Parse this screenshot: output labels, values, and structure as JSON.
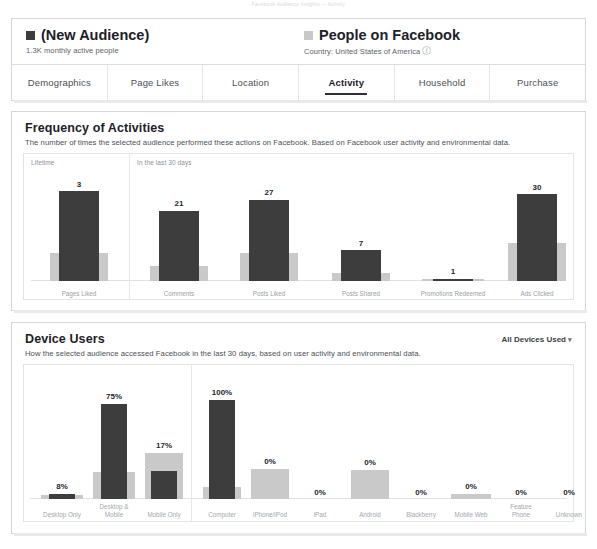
{
  "top_note": "Facebook Audience Insights — Activity",
  "header": {
    "audience": {
      "swatch": "dark-square-swatch",
      "title": "(New Audience)",
      "subtitle": "1.3K monthly active people"
    },
    "benchmark": {
      "swatch": "light-square-swatch",
      "title": "People on Facebook",
      "subtitle": "Country: United States of America",
      "info_icon": "i"
    },
    "tabs": [
      {
        "label": "Demographics",
        "active": false
      },
      {
        "label": "Page Likes",
        "active": false
      },
      {
        "label": "Location",
        "active": false
      },
      {
        "label": "Activity",
        "active": true
      },
      {
        "label": "Household",
        "active": false
      },
      {
        "label": "Purchase",
        "active": false
      }
    ]
  },
  "colors": {
    "audience_bar": "#3d3d3d",
    "benchmark_bar": "#c9c9c9",
    "card_border": "#d3d6db",
    "text_primary": "#1d2129",
    "text_muted": "#9aa0a8"
  },
  "activity_section": {
    "title": "Frequency of Activities",
    "description": "The number of times the selected audience performed these actions on Facebook. Based on Facebook user activity and environmental data.",
    "panel_labels": {
      "left": "Lifetime",
      "right": "In the last 30 days"
    }
  },
  "device_section": {
    "title": "Device Users",
    "description": "How the selected audience accessed Facebook in the last 30 days, based on user activity and environmental data.",
    "filter_label": "All Devices Used",
    "filter_caret": "chevron-down-icon"
  },
  "chart_data": [
    {
      "type": "bar",
      "title": "Frequency of Activities",
      "xlabel": "",
      "ylabel": "Number of times",
      "grid": false,
      "legend_position": "top",
      "panels": [
        {
          "name": "Lifetime",
          "categories": [
            "Pages Liked"
          ]
        },
        {
          "name": "In the last 30 days",
          "categories": [
            "Comments",
            "Posts Liked",
            "Posts Shared",
            "Promotions Redeemed",
            "Ads Clicked"
          ]
        }
      ],
      "categories": [
        "Pages Liked",
        "Comments",
        "Posts Liked",
        "Posts Shared",
        "Promotions Redeemed",
        "Ads Clicked"
      ],
      "series": [
        {
          "name": "(New Audience)",
          "labels": [
            "3",
            "21",
            "27",
            "7",
            "1",
            "30"
          ],
          "values": [
            3,
            21,
            27,
            7,
            1,
            30
          ],
          "bar_heights_pct": [
            87,
            68,
            79,
            30,
            2,
            84
          ]
        },
        {
          "name": "People on Facebook",
          "labels": [
            "",
            "",
            "",
            "",
            "",
            ""
          ],
          "values": [
            null,
            null,
            null,
            null,
            null,
            null
          ],
          "bar_heights_pct": [
            27,
            15,
            27,
            8,
            2,
            37
          ]
        }
      ]
    },
    {
      "type": "bar",
      "title": "Device Users",
      "xlabel": "",
      "ylabel": "Percent of audience",
      "grid": false,
      "legend_position": "top",
      "panels": [
        {
          "name": "Device mix",
          "categories": [
            "Desktop Only",
            "Desktop & Mobile",
            "Mobile Only"
          ]
        },
        {
          "name": "Device type",
          "categories": [
            "Computer",
            "iPhone/iPod",
            "iPad",
            "Android",
            "Blackberry",
            "Mobile Web",
            "Feature Phone",
            "Unknown"
          ]
        }
      ],
      "categories": [
        "Desktop Only",
        "Desktop & Mobile",
        "Mobile Only",
        "Computer",
        "iPhone/iPod",
        "iPad",
        "Android",
        "Blackberry",
        "Mobile Web",
        "Feature Phone",
        "Unknown"
      ],
      "series": [
        {
          "name": "(New Audience)",
          "labels": [
            "8%",
            "75%",
            "17%",
            "100%",
            "0%",
            "0%",
            "0%",
            "0%",
            "0%",
            "0%",
            "0%"
          ],
          "values": [
            8,
            75,
            17,
            100,
            0,
            0,
            0,
            0,
            0,
            0,
            0
          ],
          "bar_heights_pct": [
            5,
            88,
            26,
            92,
            0,
            0,
            0,
            0,
            0,
            0,
            0
          ]
        },
        {
          "name": "People on Facebook",
          "labels": [
            "",
            "",
            "",
            "",
            "",
            "",
            "",
            "",
            "",
            "",
            ""
          ],
          "values": [
            null,
            null,
            null,
            null,
            null,
            null,
            null,
            null,
            null,
            null,
            null
          ],
          "bar_heights_pct": [
            4,
            25,
            43,
            11,
            28,
            0,
            27,
            0,
            5,
            0,
            0
          ]
        }
      ]
    }
  ]
}
